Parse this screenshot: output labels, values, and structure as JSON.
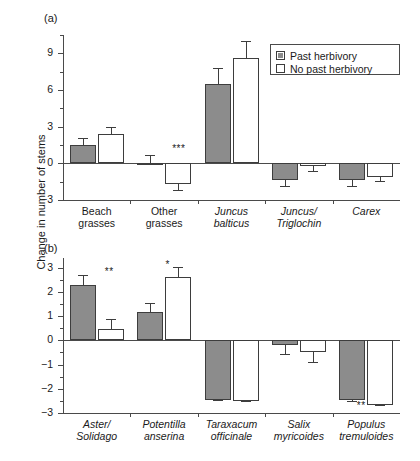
{
  "figure": {
    "ylabel": "Change in number of stems",
    "legend": {
      "items": [
        {
          "label": "Past herbivory",
          "style": "filled",
          "color": "#8c8c8c"
        },
        {
          "label": "No past herbivory",
          "style": "open",
          "color": "#ffffff"
        }
      ]
    }
  },
  "chart_data": [
    {
      "type": "bar",
      "panel": "(a)",
      "title": "",
      "xlabel": "",
      "ylabel": "Change in number of stems",
      "ylim": [
        -3,
        10.5
      ],
      "yticks": [
        -3,
        0,
        3,
        6,
        9
      ],
      "ytick_labels": [
        "-3",
        "0",
        "3",
        "6",
        "9"
      ],
      "grid": false,
      "legend_position": "upper right",
      "categories": [
        "Beach grasses",
        "Other grasses",
        "Juncus balticus",
        "Juncus/Triglochin",
        "Carex"
      ],
      "categories_italic": [
        false,
        false,
        true,
        true,
        true
      ],
      "series": [
        {
          "name": "Past herbivory",
          "style": "filled",
          "values": [
            1.5,
            0.05,
            6.5,
            -1.4,
            -1.4
          ],
          "errors": [
            0.6,
            0.6,
            1.3,
            0.55,
            0.5
          ]
        },
        {
          "name": "No past herbivory",
          "style": "open",
          "values": [
            2.4,
            -1.7,
            8.6,
            -0.2,
            -1.1
          ],
          "errors": [
            0.6,
            0.55,
            1.4,
            0.5,
            0.45
          ]
        }
      ],
      "annotations": [
        {
          "text": "***",
          "category": "Other grasses",
          "x_rel": 0.62,
          "y": 1.05
        }
      ]
    },
    {
      "type": "bar",
      "panel": "(b)",
      "title": "",
      "xlabel": "",
      "ylabel": "Change in number of stems",
      "ylim": [
        -3,
        3.4
      ],
      "yticks": [
        -3,
        -2,
        -1,
        0,
        1,
        2,
        3
      ],
      "ytick_labels": [
        "-3",
        "-2",
        "-1",
        "0",
        "1",
        "2",
        "3"
      ],
      "grid": false,
      "legend_position": "none",
      "categories": [
        "Aster/Solidago",
        "Potentilla anserina",
        "Taraxacum officinale",
        "Salix myricoides",
        "Populus tremuloides"
      ],
      "categories_italic": [
        true,
        true,
        true,
        true,
        true
      ],
      "series": [
        {
          "name": "Past herbivory",
          "style": "filled",
          "values": [
            2.3,
            1.15,
            -2.45,
            -0.2,
            -2.45
          ],
          "errors": [
            0.4,
            0.4,
            0.07,
            0.42,
            0.08
          ]
        },
        {
          "name": "No past herbivory",
          "style": "open",
          "values": [
            0.45,
            2.6,
            -2.5,
            -0.5,
            -2.65
          ],
          "errors": [
            0.43,
            0.43,
            0.05,
            0.45,
            0.05
          ]
        }
      ],
      "annotations": [
        {
          "text": "**",
          "category": "Aster/Solidago",
          "x_rel": 0.62,
          "y": 2.72
        },
        {
          "text": "*",
          "category": "Potentilla anserina",
          "x_rel": 0.52,
          "y": 3.02
        },
        {
          "text": "**",
          "category": "Populus tremuloides",
          "x_rel": 0.36,
          "y": -2.78
        }
      ]
    }
  ],
  "panels": {
    "a": {
      "tag": "(a)",
      "ytick_labels": [
        "9",
        "6",
        "3",
        "0",
        "-3"
      ],
      "xcats": [
        {
          "line1": "Beach",
          "line2": "grasses",
          "italic": false
        },
        {
          "line1": "Other",
          "line2": "grasses",
          "italic": false
        },
        {
          "line1": "Juncus",
          "line2": "balticus",
          "italic": true
        },
        {
          "line1": "Juncus/",
          "line2": "Triglochin",
          "italic": true
        },
        {
          "line1": "Carex",
          "line2": "",
          "italic": true
        }
      ],
      "sig": [
        "***"
      ]
    },
    "b": {
      "tag": "(b)",
      "ytick_labels": [
        "3",
        "2",
        "1",
        "0",
        "-1",
        "-2",
        "-3"
      ],
      "xcats": [
        {
          "line1": "Aster/",
          "line2": "Solidago",
          "italic": true
        },
        {
          "line1": "Potentilla",
          "line2": "anserina",
          "italic": true
        },
        {
          "line1": "Taraxacum",
          "line2": "officinale",
          "italic": true
        },
        {
          "line1": "Salix",
          "line2": "myricoides",
          "italic": true
        },
        {
          "line1": "Populus",
          "line2": "tremuloides",
          "italic": true
        }
      ],
      "sig": [
        "**",
        "*",
        "**"
      ]
    }
  }
}
